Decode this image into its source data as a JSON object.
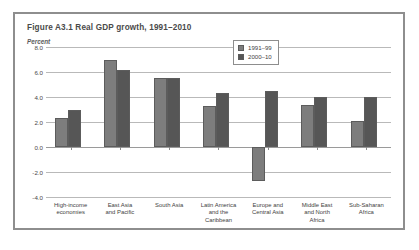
{
  "figure": {
    "title": "Figure A3.1  Real GDP growth, 1991–2010",
    "unit_label": "Percent"
  },
  "legend": {
    "entries": [
      {
        "label": "1991–99",
        "color": "#7d7d7d"
      },
      {
        "label": "2000–10",
        "color": "#565656"
      }
    ]
  },
  "axis": {
    "y_ticks": [
      "8.0",
      "6.0",
      "4.0",
      "2.0",
      "0.0",
      "-2.0",
      "-4.0"
    ]
  },
  "chart_data": {
    "type": "bar",
    "title": "Figure A3.1  Real GDP growth, 1991–2010",
    "xlabel": "",
    "ylabel": "Percent",
    "ylim": [
      -4.0,
      8.0
    ],
    "ytick_values": [
      8.0,
      6.0,
      4.0,
      2.0,
      0.0,
      -2.0,
      -4.0
    ],
    "grid": true,
    "legend_position": "upper-right-inside",
    "categories": [
      "High-income economies",
      "East Asia and Pacific",
      "South Asia",
      "Latin America and the Caribbean",
      "Europe and Central Asia",
      "Middle East and North Africa",
      "Sub-Saharan Africa"
    ],
    "category_lines": [
      [
        "High-income",
        "economies"
      ],
      [
        "East Asia",
        "and Pacific"
      ],
      [
        "South Asia"
      ],
      [
        "Latin America",
        "and the",
        "Caribbean"
      ],
      [
        "Europe and",
        "Central Asia"
      ],
      [
        "Middle East",
        "and North",
        "Africa"
      ],
      [
        "Sub-Saharan",
        "Africa"
      ]
    ],
    "series": [
      {
        "name": "1991–99",
        "color": "#7d7d7d",
        "values": [
          2.3,
          7.0,
          5.5,
          3.3,
          -2.7,
          3.4,
          2.1
        ]
      },
      {
        "name": "2000–10",
        "color": "#565656",
        "values": [
          3.0,
          6.2,
          5.5,
          4.3,
          4.5,
          4.0,
          4.0
        ]
      }
    ]
  }
}
